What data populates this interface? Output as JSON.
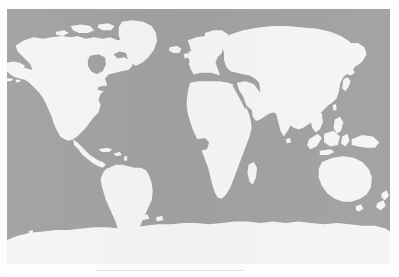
{
  "document": {
    "type": "figure",
    "figure_kind": "world-map",
    "page_background": "#fdfdfd"
  },
  "map": {
    "title": "",
    "projection": "equirectangular",
    "ocean_color": "#9c9c9c",
    "land_color": "#f5f5f5",
    "outline_color": "#9c9c9c",
    "frame": {
      "x": 7,
      "y": 9,
      "width": 383,
      "height": 255
    },
    "lon_range": [
      -180,
      180
    ],
    "lat_range": [
      -90,
      90
    ],
    "graticule": false,
    "labels": [],
    "legend": [],
    "regions": [
      {
        "name": "North America",
        "visible": true
      },
      {
        "name": "Greenland",
        "visible": true
      },
      {
        "name": "South America",
        "visible": true
      },
      {
        "name": "Europe",
        "visible": true
      },
      {
        "name": "Africa",
        "visible": true
      },
      {
        "name": "Asia",
        "visible": true
      },
      {
        "name": "Australia",
        "visible": true
      },
      {
        "name": "Antarctica",
        "visible": true
      },
      {
        "name": "Madagascar",
        "visible": true
      },
      {
        "name": "Japan",
        "visible": true
      },
      {
        "name": "Indonesia",
        "visible": true
      },
      {
        "name": "New Zealand",
        "visible": true
      },
      {
        "name": "British Isles",
        "visible": true
      },
      {
        "name": "Iceland",
        "visible": true
      }
    ]
  }
}
